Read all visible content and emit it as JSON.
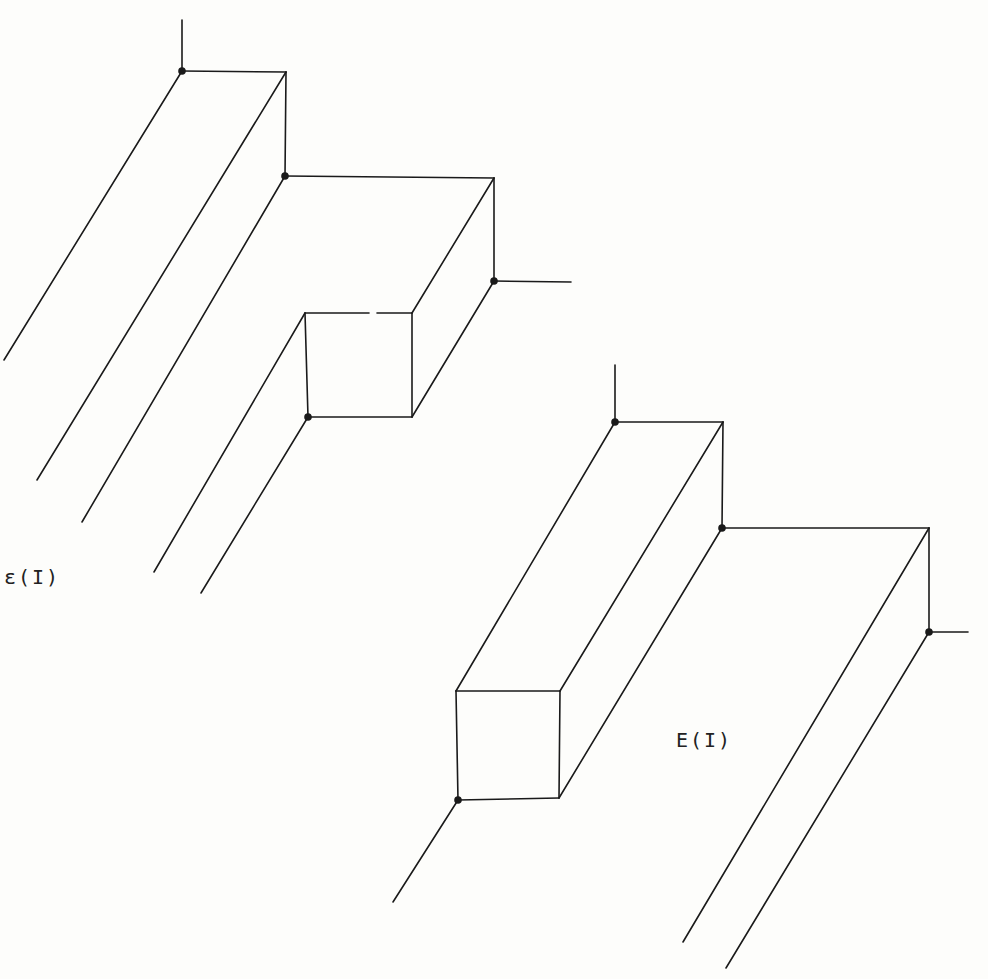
{
  "colors": {
    "ink": "#1a1a1a",
    "paper": "#fdfdfb"
  },
  "figures": [
    {
      "id": "upper",
      "label": "ε(I)",
      "label_pos": {
        "x": 4,
        "y": 565
      },
      "segments": [
        [
          182,
          20,
          182,
          71
        ],
        [
          182,
          71,
          286,
          72
        ],
        [
          286,
          72,
          285,
          176
        ],
        [
          285,
          176,
          494,
          178
        ],
        [
          494,
          178,
          494,
          281
        ],
        [
          494,
          281,
          571,
          282
        ],
        [
          305,
          313,
          369,
          313
        ],
        [
          377,
          313,
          412,
          313
        ],
        [
          305,
          313,
          308,
          417
        ],
        [
          308,
          417,
          412,
          417
        ],
        [
          412,
          313,
          412,
          417
        ],
        [
          412,
          313,
          494,
          178
        ],
        [
          412,
          417,
          494,
          281
        ],
        [
          182,
          71,
          4,
          360
        ],
        [
          286,
          72,
          37,
          480
        ],
        [
          285,
          176,
          82,
          522
        ],
        [
          305,
          313,
          154,
          572
        ],
        [
          308,
          417,
          201,
          593
        ]
      ],
      "dots": [
        [
          182,
          71
        ],
        [
          285,
          176
        ],
        [
          494,
          281
        ],
        [
          308,
          417
        ]
      ]
    },
    {
      "id": "lower",
      "label": "E(I)",
      "label_pos": {
        "x": 676,
        "y": 728
      },
      "segments": [
        [
          615,
          365,
          615,
          422
        ],
        [
          615,
          422,
          723,
          422
        ],
        [
          723,
          422,
          722,
          528
        ],
        [
          722,
          528,
          929,
          528
        ],
        [
          929,
          528,
          929,
          632
        ],
        [
          929,
          632,
          968,
          632
        ],
        [
          456,
          691,
          560,
          691
        ],
        [
          456,
          691,
          458,
          800
        ],
        [
          458,
          800,
          559,
          798
        ],
        [
          560,
          691,
          559,
          798
        ],
        [
          456,
          691,
          615,
          422
        ],
        [
          560,
          691,
          723,
          422
        ],
        [
          559,
          798,
          722,
          528
        ],
        [
          458,
          800,
          393,
          902
        ],
        [
          929,
          528,
          683,
          942
        ],
        [
          929,
          632,
          726,
          968
        ]
      ],
      "dots": [
        [
          615,
          422
        ],
        [
          722,
          528
        ],
        [
          929,
          632
        ],
        [
          458,
          800
        ]
      ]
    }
  ]
}
